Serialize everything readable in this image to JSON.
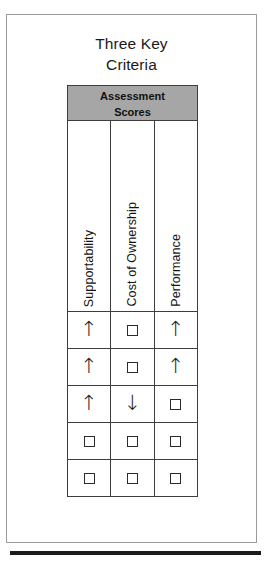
{
  "title": {
    "line1": "Three Key",
    "line2": "Criteria"
  },
  "table": {
    "banner": {
      "line1": "Assessment",
      "line2": "Scores"
    },
    "columns": [
      {
        "label": "Supportability"
      },
      {
        "label": "Cost of Ownership"
      },
      {
        "label": "Performance"
      }
    ],
    "rows": [
      {
        "cells": [
          "up-arrow",
          "square",
          "up-arrow"
        ]
      },
      {
        "cells": [
          "up-arrow",
          "square",
          "up-arrow"
        ]
      },
      {
        "cells": [
          "up-arrow",
          "down-arrow",
          "square"
        ]
      },
      {
        "cells": [
          "square",
          "square",
          "square"
        ]
      },
      {
        "cells": [
          "square",
          "square",
          "square"
        ]
      }
    ]
  },
  "glyphs": {
    "up-arrow": "↑",
    "down-arrow": "↓",
    "square": ""
  },
  "colors": {
    "banner_background": "#a6a6a6",
    "table_border": "#3d3d3d",
    "frame_border": "#9a9a9a",
    "rule": "#1c1c1c",
    "text": "#1a1a1a"
  }
}
